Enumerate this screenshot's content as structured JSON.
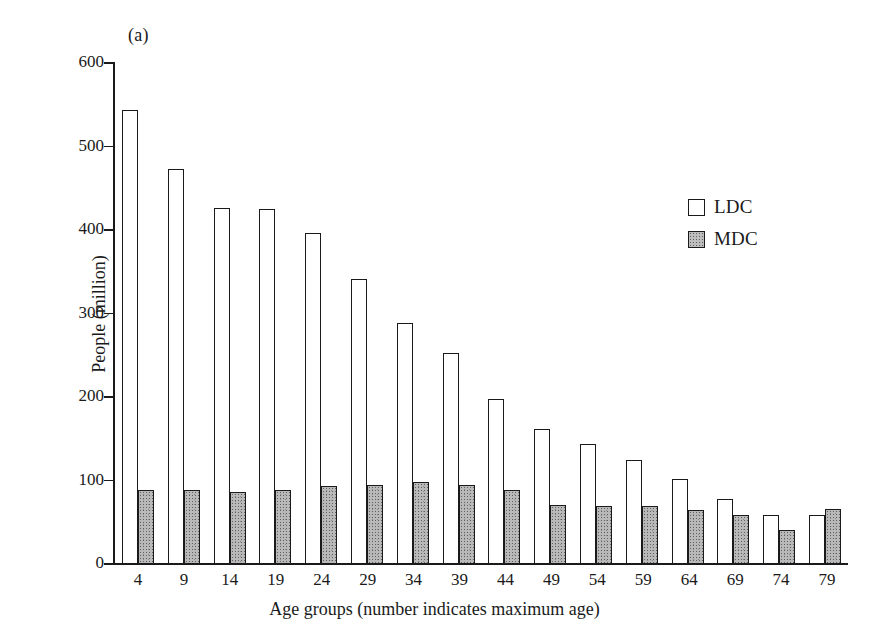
{
  "figure": {
    "panel_label": "(a)"
  },
  "legend": {
    "position": "upper-right",
    "entries": [
      {
        "label": "LDC",
        "swatch": "white-open-square"
      },
      {
        "label": "MDC",
        "swatch": "stippled-gray-square"
      }
    ]
  },
  "axes": {
    "ylabel": "People (million)",
    "xlabel": "Age groups (number indicates maximum age)",
    "yticks": [
      600,
      500,
      400,
      300,
      200,
      100,
      0
    ],
    "ylim": [
      0,
      600
    ]
  },
  "chart_data": {
    "type": "bar",
    "title": "(a)",
    "xlabel": "Age groups (number indicates maximum age)",
    "ylabel": "People (million)",
    "ylim": [
      0,
      600
    ],
    "yticks": [
      0,
      100,
      200,
      300,
      400,
      500,
      600
    ],
    "grid": false,
    "legend_position": "upper-right",
    "categories": [
      "4",
      "9",
      "14",
      "19",
      "24",
      "29",
      "34",
      "39",
      "44",
      "49",
      "54",
      "59",
      "64",
      "69",
      "74",
      "79"
    ],
    "series": [
      {
        "name": "LDC",
        "fill": "white-open",
        "values": [
          542,
          472,
          425,
          424,
          395,
          340,
          287,
          252,
          196,
          161,
          142,
          123,
          101,
          77,
          58,
          58
        ]
      },
      {
        "name": "MDC",
        "fill": "stippled-gray",
        "values": [
          87,
          87,
          85,
          88,
          92,
          93,
          97,
          93,
          88,
          69,
          68,
          68,
          64,
          57,
          40,
          65
        ]
      }
    ]
  },
  "colors": {
    "ink": "#1a1a1a",
    "ldc_fill": "#ffffff",
    "mdc_fill": "#bdbdbd",
    "background": "#ffffff"
  }
}
